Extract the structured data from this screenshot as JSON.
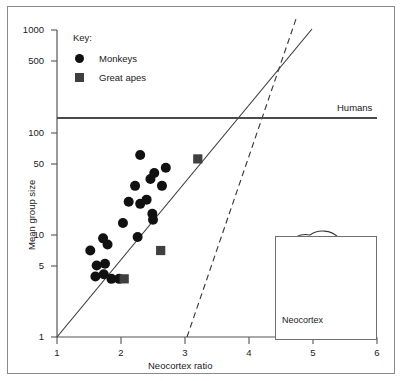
{
  "figure": {
    "axis_labels": {
      "x": "Neocortex ratio",
      "y": "Mean group size"
    },
    "key": {
      "title": "Key:",
      "entries": [
        {
          "label": "Monkeys",
          "marker": "circle-marker",
          "color": "#111111"
        },
        {
          "label": "Great apes",
          "marker": "square-marker",
          "color": "#3f3f3f"
        }
      ]
    },
    "annotations": {
      "humans_line_label": "Humans",
      "inset_label": "Neocortex",
      "inset_icon": "brain-sagittal-icon"
    }
  },
  "chart_data": {
    "type": "scatter",
    "title": "",
    "xlabel": "Neocortex ratio",
    "ylabel": "Mean group size",
    "xlim": [
      1,
      6
    ],
    "ylim": [
      1,
      1000
    ],
    "yscale": "log",
    "xscale": "linear",
    "grid": false,
    "legend_position": "top-left",
    "xticks": [
      1,
      2,
      3,
      4,
      5,
      6
    ],
    "yticks": [
      1,
      5,
      10,
      50,
      100,
      500,
      1000
    ],
    "ytick_labels": [
      "1",
      "5",
      "10",
      "50",
      "100",
      "500",
      "1000"
    ],
    "xtick_labels": [
      "1",
      "2",
      "3",
      "4",
      "5",
      "6"
    ],
    "series": [
      {
        "name": "Monkeys",
        "marker": "circle",
        "color": "#111111",
        "points": [
          {
            "x": 1.52,
            "y": 7.0
          },
          {
            "x": 1.6,
            "y": 3.9
          },
          {
            "x": 1.72,
            "y": 9.2
          },
          {
            "x": 1.79,
            "y": 8.0
          },
          {
            "x": 1.75,
            "y": 5.2
          },
          {
            "x": 1.73,
            "y": 4.1
          },
          {
            "x": 1.85,
            "y": 3.7
          },
          {
            "x": 1.97,
            "y": 3.7
          },
          {
            "x": 2.03,
            "y": 13.0
          },
          {
            "x": 2.12,
            "y": 21.0
          },
          {
            "x": 2.22,
            "y": 30.0
          },
          {
            "x": 2.3,
            "y": 60.0
          },
          {
            "x": 2.26,
            "y": 9.5
          },
          {
            "x": 2.3,
            "y": 20.0
          },
          {
            "x": 2.4,
            "y": 22.0
          },
          {
            "x": 2.46,
            "y": 35.0
          },
          {
            "x": 2.52,
            "y": 40.0
          },
          {
            "x": 2.49,
            "y": 16.0
          },
          {
            "x": 2.5,
            "y": 14.0
          },
          {
            "x": 2.64,
            "y": 30.0
          },
          {
            "x": 2.7,
            "y": 45.0
          },
          {
            "x": 1.62,
            "y": 5.0
          }
        ]
      },
      {
        "name": "Great apes",
        "marker": "square",
        "color": "#3f3f3f",
        "points": [
          {
            "x": 2.05,
            "y": 3.7
          },
          {
            "x": 2.62,
            "y": 7.0
          },
          {
            "x": 3.2,
            "y": 55.0
          }
        ]
      }
    ],
    "reference_lines": [
      {
        "name": "monkey-regression-line",
        "style": "solid",
        "from": {
          "x": 1.0,
          "y": 1.0
        },
        "to": {
          "x": 5.0,
          "y": 1000.0
        }
      },
      {
        "name": "ape-regression-line",
        "style": "dashed",
        "from": {
          "x": 3.03,
          "y": 1.0
        },
        "to": {
          "x": 4.73,
          "y": 1000.0
        }
      },
      {
        "name": "humans-group-size-line",
        "style": "solid-horizontal",
        "y": 150,
        "label": "Humans"
      }
    ]
  }
}
